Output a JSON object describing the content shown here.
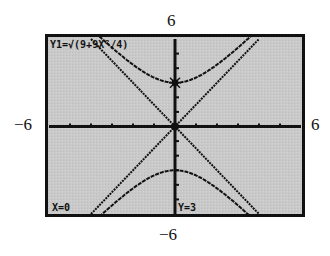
{
  "window": {
    "xmin": -6,
    "xmax": 6,
    "ymin": -6,
    "ymax": 6,
    "xscl": 1,
    "yscl": 1
  },
  "labels": {
    "top": "6",
    "bottom": "−6",
    "left": "−6",
    "right": "6"
  },
  "screen": {
    "equation": "Y1=√(9+9X²/4)",
    "cursor_x": "X=0",
    "cursor_y": "Y=3",
    "background": "#c8c8c8",
    "ink": "#111111"
  },
  "chart_data": {
    "type": "line",
    "title": "Y1=√(9+9X²/4)",
    "xlabel": "",
    "ylabel": "",
    "xlim": [
      -6,
      6
    ],
    "ylim": [
      -6,
      6
    ],
    "grid": false,
    "series": [
      {
        "name": "upper branch y = sqrt(9+9x^2/4)",
        "x": [
          -4,
          -3,
          -2,
          -1,
          0,
          1,
          2,
          3,
          4
        ],
        "y": [
          7.21,
          5.41,
          4.24,
          3.35,
          3,
          3.35,
          4.24,
          5.41,
          7.21
        ]
      },
      {
        "name": "lower branch y = -sqrt(9+9x^2/4)",
        "x": [
          -4,
          -3,
          -2,
          -1,
          0,
          1,
          2,
          3,
          4
        ],
        "y": [
          -7.21,
          -5.41,
          -4.24,
          -3.35,
          -3,
          -3.35,
          -4.24,
          -5.41,
          -7.21
        ]
      },
      {
        "name": "asymptote y = 1.5x",
        "x": [
          -4,
          4
        ],
        "y": [
          -6,
          6
        ]
      },
      {
        "name": "asymptote y = -1.5x",
        "x": [
          -4,
          4
        ],
        "y": [
          6,
          -6
        ]
      }
    ],
    "annotations": [
      {
        "text": "X=0",
        "position": "bottom-left"
      },
      {
        "text": "Y=3",
        "position": "bottom-center"
      },
      {
        "text": "trace cursor",
        "x": 0,
        "y": 3
      }
    ],
    "axis_labels": {
      "top": "6",
      "bottom": "-6",
      "left": "-6",
      "right": "6"
    }
  }
}
